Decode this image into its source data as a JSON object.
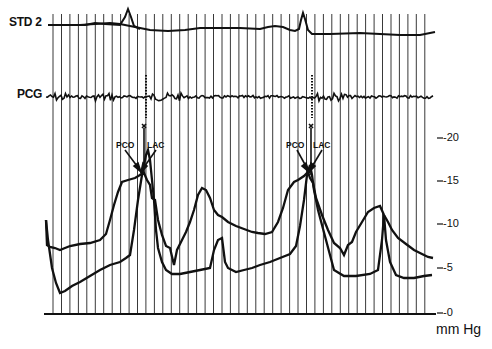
{
  "chart_data": {
    "type": "line",
    "title": "",
    "xlabel": "",
    "ylabel": "mm Hg",
    "ylim": [
      0,
      20
    ],
    "y_ticks": [
      "-0",
      "-5",
      "-10",
      "-15",
      "-20"
    ],
    "grid": "vertical time-marker lines",
    "traces": [
      {
        "name": "STD 2",
        "description": "ECG-like trace with sharp spikes at two beats"
      },
      {
        "name": "PCG",
        "description": "phonocardiogram with noise bursts at valve events"
      }
    ],
    "series": [
      {
        "name": "Left atrial pressure (upper curve)",
        "x": [
          0,
          5,
          10,
          20,
          30,
          40,
          45,
          48,
          50,
          53,
          56,
          60,
          65,
          70,
          75,
          80,
          85,
          90,
          95,
          100
        ],
        "values": [
          7.5,
          7,
          7.5,
          8.5,
          15,
          16,
          16.5,
          17,
          15,
          12,
          8,
          11,
          14.5,
          13,
          9,
          8.5,
          7.5,
          15,
          16.5,
          17
        ]
      },
      {
        "name": "Left ventricular pressure (lower curve)",
        "x": [
          0,
          2,
          5,
          10,
          20,
          30,
          40,
          44,
          47,
          50,
          55,
          60,
          65,
          70,
          75,
          80
        ],
        "values": [
          5,
          1.5,
          2.5,
          4,
          5.5,
          7,
          10,
          15,
          17,
          12,
          8,
          6,
          5.5,
          5,
          6,
          7
        ]
      }
    ],
    "annotations": [
      {
        "label": "PCO",
        "beat": 1
      },
      {
        "label": "LAC",
        "beat": 1
      },
      {
        "label": "PCO",
        "beat": 2
      },
      {
        "label": "LAC",
        "beat": 2
      }
    ]
  },
  "labels": {
    "std2": "STD 2",
    "pcg": "PCG",
    "pco": "PCO",
    "lac": "LAC",
    "unit": "mm Hg",
    "ticks": [
      "-20",
      "-15",
      "-10",
      "-5",
      "-0"
    ]
  }
}
